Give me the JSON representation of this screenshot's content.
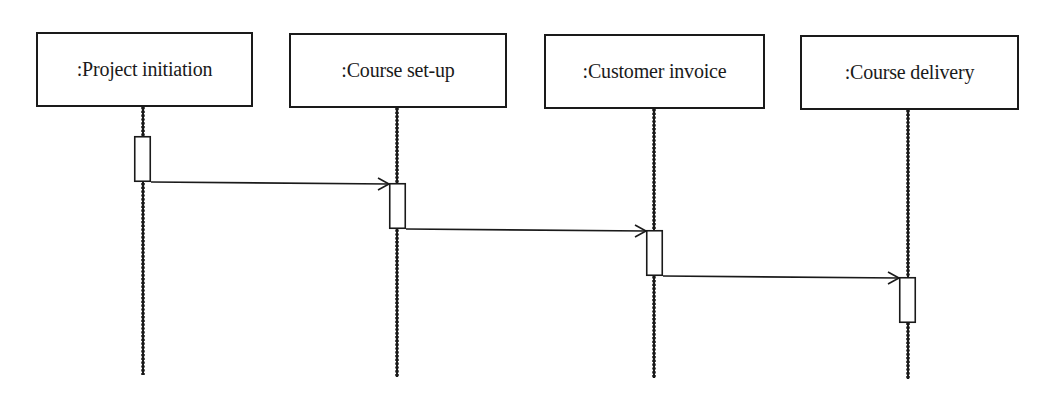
{
  "diagram": {
    "type": "UML sequence diagram",
    "line_color": "#1a1a1a",
    "background": "#ffffff",
    "lifelines": [
      {
        "id": "project-initiation",
        "label": ":Project initiation",
        "box": {
          "x": 36,
          "y": 32,
          "w": 217,
          "h": 75
        },
        "line_x": 143,
        "line_y_end": 375,
        "activation": {
          "x": 134,
          "y": 136,
          "w": 17,
          "h": 46
        }
      },
      {
        "id": "course-set-up",
        "label": ":Course set-up",
        "box": {
          "x": 289,
          "y": 33,
          "w": 218,
          "h": 75
        },
        "line_x": 397,
        "line_y_end": 377,
        "activation": {
          "x": 389,
          "y": 183,
          "w": 17,
          "h": 46
        }
      },
      {
        "id": "customer-invoice",
        "label": ":Customer invoice",
        "box": {
          "x": 544,
          "y": 34,
          "w": 221,
          "h": 75
        },
        "line_x": 654,
        "line_y_end": 378,
        "activation": {
          "x": 646,
          "y": 230,
          "w": 17,
          "h": 46
        }
      },
      {
        "id": "course-delivery",
        "label": ":Course delivery",
        "box": {
          "x": 800,
          "y": 35,
          "w": 219,
          "h": 75
        },
        "line_x": 908,
        "line_y_end": 379,
        "activation": {
          "x": 899,
          "y": 277,
          "w": 17,
          "h": 46
        }
      }
    ],
    "messages": [
      {
        "from": "project-initiation",
        "to": "course-set-up",
        "x1": 151,
        "y1": 182,
        "x2": 389,
        "y2": 184,
        "arrow": "open"
      },
      {
        "from": "course-set-up",
        "to": "customer-invoice",
        "x1": 406,
        "y1": 229,
        "x2": 646,
        "y2": 231,
        "arrow": "open"
      },
      {
        "from": "customer-invoice",
        "to": "course-delivery",
        "x1": 663,
        "y1": 276,
        "x2": 899,
        "y2": 278,
        "arrow": "open"
      }
    ]
  }
}
